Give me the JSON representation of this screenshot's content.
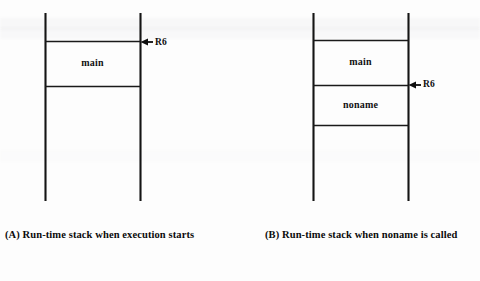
{
  "figure": {
    "type": "run-time-stack-diagram",
    "panels": [
      {
        "id": "A",
        "caption": "(A) Run-time stack when execution starts",
        "frames": [
          {
            "name": "main"
          }
        ],
        "pointers": [
          {
            "label": "R6",
            "icon": "left-arrow-icon"
          }
        ]
      },
      {
        "id": "B",
        "caption": "(B) Run-time stack when noname is called",
        "frames": [
          {
            "name": "main"
          },
          {
            "name": "noname"
          }
        ],
        "pointers": [
          {
            "label": "R6",
            "icon": "left-arrow-icon"
          }
        ]
      }
    ],
    "colors": {
      "ink": "#111111",
      "background": "#fdfdfd",
      "rule": "#1a1a1a"
    }
  }
}
